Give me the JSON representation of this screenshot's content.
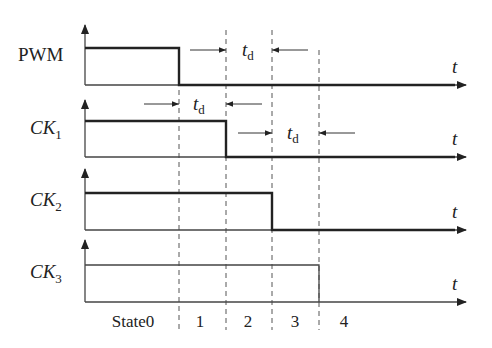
{
  "diagram": {
    "title": "",
    "time_axis_label": "t",
    "delay_label": "t",
    "delay_subscript": "d",
    "signals": [
      {
        "name": "PWM",
        "subscript": "",
        "italic": false,
        "label_x": 18,
        "label_y": 61,
        "axis_top": 25,
        "high_y": 48,
        "base_y": 85,
        "fall_x": 179,
        "thick": true
      },
      {
        "name": "CK",
        "subscript": "1",
        "italic": true,
        "label_x": 30,
        "label_y": 134,
        "axis_top": 100,
        "high_y": 121,
        "base_y": 157,
        "fall_x": 226,
        "thick": true
      },
      {
        "name": "CK",
        "subscript": "2",
        "italic": true,
        "label_x": 30,
        "label_y": 206,
        "axis_top": 169,
        "high_y": 193,
        "base_y": 230,
        "fall_x": 272,
        "thick": true
      },
      {
        "name": "CK",
        "subscript": "3",
        "italic": true,
        "label_x": 30,
        "label_y": 278,
        "axis_top": 240,
        "high_y": 265,
        "base_y": 302,
        "fall_x": 319,
        "thick": false
      }
    ],
    "boundaries": [
      {
        "x": 179,
        "y_top": 90,
        "y_bottom": 330
      },
      {
        "x": 226,
        "y_top": 30,
        "y_bottom": 330
      },
      {
        "x": 272,
        "y_top": 30,
        "y_bottom": 330
      },
      {
        "x": 319,
        "y_top": 50,
        "y_bottom": 330
      }
    ],
    "delay_annotations": [
      {
        "y": 50,
        "left_from": 190,
        "left_to": 226,
        "right_from": 308,
        "right_to": 272,
        "label_x": 242,
        "label_y": 56
      },
      {
        "y": 104,
        "left_from": 144,
        "left_to": 179,
        "right_from": 262,
        "right_to": 226,
        "label_x": 193,
        "label_y": 110
      },
      {
        "y": 133,
        "left_from": 238,
        "left_to": 272,
        "right_from": 355,
        "right_to": 319,
        "label_x": 287,
        "label_y": 139
      }
    ],
    "states": [
      {
        "label": "State0",
        "x": 133
      },
      {
        "label": "1",
        "x": 200
      },
      {
        "label": "2",
        "x": 248
      },
      {
        "label": "3",
        "x": 295
      },
      {
        "label": "4",
        "x": 344
      }
    ],
    "state_label_y": 327,
    "axis_x": 85,
    "axis_end_x": 466
  }
}
